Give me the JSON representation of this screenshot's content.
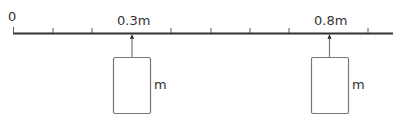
{
  "diagram": {
    "origin_label": "0",
    "ruler": {
      "ticks": 10,
      "tick_spacing_m": 0.1
    },
    "masses": [
      {
        "position_label": "0.3m",
        "mass_label": "m"
      },
      {
        "position_label": "0.8m",
        "mass_label": "m"
      }
    ]
  }
}
